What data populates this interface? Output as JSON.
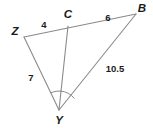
{
  "figure": {
    "background_color": "#ffffff",
    "stroke_color": "#8a8a8a",
    "text_color": "#1b1b1b",
    "vertices": [
      {
        "name": "Z",
        "label": "Z",
        "x": 24,
        "y": 37,
        "label_x": 15,
        "label_y": 32
      },
      {
        "name": "C",
        "label": "C",
        "x": 68,
        "y": 26,
        "label_x": 68,
        "label_y": 15
      },
      {
        "name": "B",
        "label": "B",
        "x": 136,
        "y": 14,
        "label_x": 142,
        "label_y": 9
      },
      {
        "name": "Y",
        "label": "Y",
        "x": 59,
        "y": 110,
        "label_x": 59,
        "label_y": 121
      }
    ],
    "segments": [
      {
        "name": "segment-ZB",
        "from": "Z",
        "to": "B"
      },
      {
        "name": "segment-ZY",
        "from": "Z",
        "to": "Y"
      },
      {
        "name": "segment-CY",
        "from": "C",
        "to": "Y"
      },
      {
        "name": "segment-YB",
        "from": "Y",
        "to": "B"
      }
    ],
    "measures": [
      {
        "name": "measure-ZC",
        "segment": "ZC",
        "value": "4",
        "x": 44,
        "y": 25
      },
      {
        "name": "measure-CB",
        "segment": "CB",
        "value": "6",
        "x": 108,
        "y": 18
      },
      {
        "name": "measure-ZY",
        "segment": "ZY",
        "value": "7",
        "x": 31,
        "y": 78
      },
      {
        "name": "measure-YB",
        "segment": "YB",
        "value": "10.5",
        "x": 115,
        "y": 69
      }
    ],
    "angle_marks": [
      {
        "name": "angle-arc-ZYC",
        "at": "Y",
        "between": "ZY-CY"
      },
      {
        "name": "angle-arc-CYB",
        "at": "Y",
        "between": "CY-YB"
      }
    ]
  }
}
